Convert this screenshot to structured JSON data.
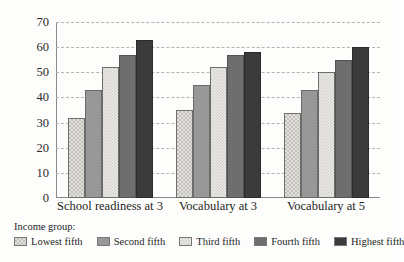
{
  "chart_data": {
    "type": "bar",
    "title": "",
    "subtitle": "",
    "xlabel": "",
    "ylabel": "",
    "ylim": [
      0,
      70
    ],
    "ytick_values": [
      0,
      10,
      20,
      30,
      40,
      50,
      60,
      70
    ],
    "ytick_labels": [
      "0",
      "10",
      "20",
      "30",
      "40",
      "50",
      "60",
      "70"
    ],
    "grid": true,
    "grid_style": "dashed horizontal",
    "legend_position": "bottom-left",
    "legend_title": "Income group:",
    "categories": [
      "School readiness at 3",
      "Vocabulary at 3",
      "Vocabulary at 5"
    ],
    "series": [
      {
        "name": "Lowest fifth",
        "values": [
          32,
          35,
          34
        ],
        "color": "#e2e0dd",
        "pattern": "checker-light"
      },
      {
        "name": "Second fifth",
        "values": [
          43,
          45,
          43
        ],
        "color": "#989898",
        "pattern": "solid-mid"
      },
      {
        "name": "Third fifth",
        "values": [
          52,
          52,
          50
        ],
        "color": "#eceae7",
        "pattern": "checker-fine"
      },
      {
        "name": "Fourth fifth",
        "values": [
          57,
          57,
          55
        ],
        "color": "#6e6e6e",
        "pattern": "solid-dark"
      },
      {
        "name": "Highest fifth",
        "values": [
          63,
          58,
          60
        ],
        "color": "#3b3b3b",
        "pattern": "solid-darkest"
      }
    ]
  },
  "colors": {
    "background": "#fdfdfc",
    "axis": "#8a8a8a",
    "gridline": "#b9b2b2",
    "text": "#1d1d1d"
  }
}
